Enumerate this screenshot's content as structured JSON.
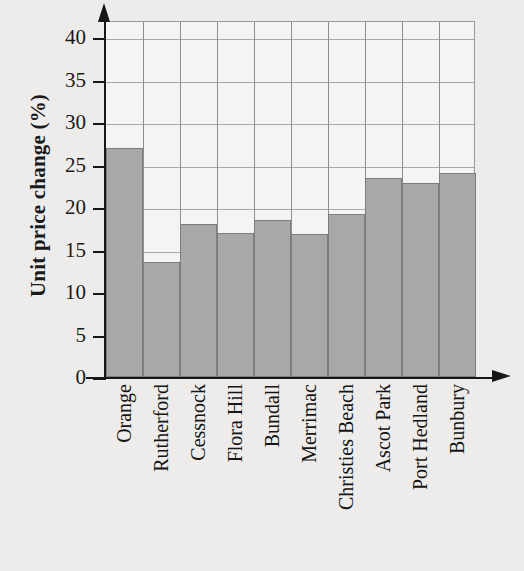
{
  "chart_data": {
    "type": "bar",
    "title": "",
    "xlabel": "",
    "ylabel": "Unit price change (%)",
    "categories": [
      "Orange",
      "Rutherford",
      "Cessnock",
      "Flora Hill",
      "Bundall",
      "Merrimac",
      "Christies Beach",
      "Ascot Park",
      "Port Hedland",
      "Bunbury"
    ],
    "values": [
      27,
      13.5,
      18,
      17,
      18.5,
      16.8,
      19.2,
      23.4,
      22.8,
      24
    ],
    "ylim": [
      0,
      42
    ],
    "yticks": [
      0,
      5,
      10,
      15,
      20,
      25,
      30,
      35,
      40
    ],
    "ytick_labels": [
      "0",
      "5",
      "10",
      "15",
      "20",
      "25",
      "30",
      "35",
      "40"
    ],
    "grid": true,
    "legend": "none",
    "bar_color": "#a8a8a6",
    "bar_edge_color": "#7d7d7b",
    "plot_background": "#f4f4f2",
    "figure_background": "#edecea",
    "axis_color": "#17171a",
    "gridline_color": "#a8a8a6"
  },
  "axes": {
    "y_axis_title": "Unit price change (%)",
    "y_arrow_icon": "arrow-up-icon",
    "x_arrow_icon": "arrow-right-icon"
  }
}
